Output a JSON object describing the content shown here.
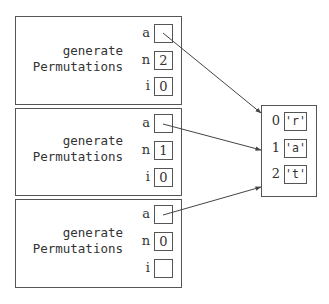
{
  "diagram": {
    "type": "call-stack-memory-diagram",
    "frames": [
      {
        "name_line1": "generate",
        "name_line2": "Permutations",
        "vars": [
          {
            "label": "a",
            "value": "",
            "points_to": "array"
          },
          {
            "label": "n",
            "value": "2"
          },
          {
            "label": "i",
            "value": "0"
          }
        ]
      },
      {
        "name_line1": "generate",
        "name_line2": "Permutations",
        "vars": [
          {
            "label": "a",
            "value": "",
            "points_to": "array"
          },
          {
            "label": "n",
            "value": "1"
          },
          {
            "label": "i",
            "value": "0"
          }
        ]
      },
      {
        "name_line1": "generate",
        "name_line2": "Permutations",
        "vars": [
          {
            "label": "a",
            "value": "",
            "points_to": "array"
          },
          {
            "label": "n",
            "value": "0"
          },
          {
            "label": "i",
            "value": ""
          }
        ]
      }
    ],
    "array": {
      "cells": [
        {
          "index": "0",
          "value": "'r'"
        },
        {
          "index": "1",
          "value": "'a'"
        },
        {
          "index": "2",
          "value": "'t'"
        }
      ]
    },
    "colors": {
      "line": "#555555",
      "text": "#333333",
      "background": "#ffffff"
    }
  }
}
